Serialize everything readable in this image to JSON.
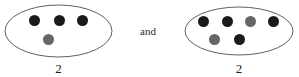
{
  "figure": {
    "width": 299,
    "height": 77,
    "background_color": "#ffffff",
    "conjunction_text": "and",
    "colors": {
      "dark_dot": "#1a1a1a",
      "gray_dot": "#666666",
      "ellipse_stroke": "#4d4d4d",
      "text": "#1b1b1b"
    }
  },
  "groups": [
    {
      "id": "left-group",
      "label": "2",
      "ellipse": {
        "cx": 58.5,
        "cy": 31,
        "rx": 53.5,
        "ry": 26
      },
      "dots": [
        {
          "id": "dot-1",
          "color_name": "dark",
          "color": "#1a1a1a",
          "cx": 34,
          "cy": 20,
          "r": 5.5
        },
        {
          "id": "dot-2",
          "color_name": "dark",
          "color": "#1a1a1a",
          "cx": 59,
          "cy": 20,
          "r": 5.5
        },
        {
          "id": "dot-3",
          "color_name": "dark",
          "color": "#1a1a1a",
          "cx": 82,
          "cy": 20,
          "r": 5.5
        },
        {
          "id": "dot-4",
          "color_name": "gray",
          "color": "#666666",
          "cx": 48,
          "cy": 39,
          "r": 5.5
        }
      ],
      "label_position": {
        "x": 58.5,
        "y": 62
      }
    },
    {
      "id": "right-group",
      "label": "2",
      "ellipse": {
        "cx": 239,
        "cy": 31,
        "rx": 54,
        "ry": 24
      },
      "dots": [
        {
          "id": "dot-1",
          "color_name": "dark",
          "color": "#1a1a1a",
          "cx": 203,
          "cy": 21,
          "r": 5.5
        },
        {
          "id": "dot-2",
          "color_name": "dark",
          "color": "#1a1a1a",
          "cx": 227,
          "cy": 21,
          "r": 5.5
        },
        {
          "id": "dot-3",
          "color_name": "gray",
          "color": "#666666",
          "cx": 250,
          "cy": 21,
          "r": 5.5
        },
        {
          "id": "dot-4",
          "color_name": "dark",
          "color": "#1a1a1a",
          "cx": 273,
          "cy": 21,
          "r": 5.5
        },
        {
          "id": "dot-5",
          "color_name": "gray",
          "color": "#666666",
          "cx": 214,
          "cy": 39,
          "r": 5.5
        },
        {
          "id": "dot-6",
          "color_name": "dark",
          "color": "#1a1a1a",
          "cx": 239,
          "cy": 39,
          "r": 5.5
        }
      ],
      "label_position": {
        "x": 239,
        "y": 62
      }
    }
  ],
  "conjunction_position": {
    "x": 148,
    "y": 31
  }
}
